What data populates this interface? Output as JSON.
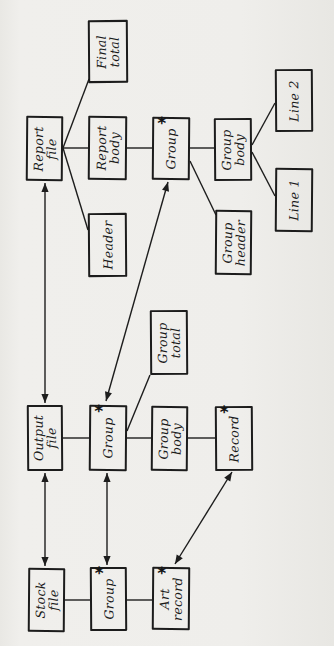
{
  "diagram": {
    "type": "jackson-structure-diagram",
    "ink_color": "#1d1d1d",
    "paper_color": "#efeeeb",
    "iteration_marker": "*",
    "nodes": [
      {
        "id": "report-file",
        "label": "Report\nfile",
        "marker": "",
        "x": 26,
        "y": 116,
        "w": 37,
        "h": 65
      },
      {
        "id": "final-total",
        "label": "Final\ntotal",
        "marker": "",
        "x": 88,
        "y": 20,
        "w": 40,
        "h": 63
      },
      {
        "id": "report-body",
        "label": "Report\nbody",
        "marker": "",
        "x": 88,
        "y": 116,
        "w": 39,
        "h": 64
      },
      {
        "id": "header",
        "label": "Header",
        "marker": "",
        "x": 88,
        "y": 213,
        "w": 39,
        "h": 64
      },
      {
        "id": "group-report",
        "label": "Group",
        "marker": "*",
        "x": 152,
        "y": 117,
        "w": 38,
        "h": 63
      },
      {
        "id": "group-body-report",
        "label": "Group\nbody",
        "marker": "",
        "x": 214,
        "y": 118,
        "w": 38,
        "h": 63
      },
      {
        "id": "group-header",
        "label": "Group\nheader",
        "marker": "",
        "x": 215,
        "y": 210,
        "w": 37,
        "h": 65
      },
      {
        "id": "line-2",
        "label": "Line 2",
        "marker": "",
        "x": 275,
        "y": 69,
        "w": 38,
        "h": 63
      },
      {
        "id": "line-1",
        "label": "Line 1",
        "marker": "",
        "x": 275,
        "y": 168,
        "w": 38,
        "h": 64
      },
      {
        "id": "output-file",
        "label": "Output\nfile",
        "marker": "",
        "x": 27,
        "y": 405,
        "w": 36,
        "h": 66
      },
      {
        "id": "group-output",
        "label": "Group",
        "marker": "*",
        "x": 89,
        "y": 405,
        "w": 38,
        "h": 66
      },
      {
        "id": "group-total",
        "label": "Group\ntotal",
        "marker": "",
        "x": 150,
        "y": 310,
        "w": 38,
        "h": 65
      },
      {
        "id": "group-body-output",
        "label": "Group\nbody",
        "marker": "",
        "x": 151,
        "y": 406,
        "w": 37,
        "h": 65
      },
      {
        "id": "record",
        "label": "Record",
        "marker": "*",
        "x": 215,
        "y": 406,
        "w": 38,
        "h": 65
      },
      {
        "id": "stock-file",
        "label": "Stock\nfile",
        "marker": "",
        "x": 28,
        "y": 568,
        "w": 37,
        "h": 64
      },
      {
        "id": "group-stock",
        "label": "Group",
        "marker": "*",
        "x": 90,
        "y": 567,
        "w": 37,
        "h": 64
      },
      {
        "id": "art-record",
        "label": "Art\nrecord",
        "marker": "*",
        "x": 152,
        "y": 567,
        "w": 38,
        "h": 63
      }
    ],
    "edges": [
      {
        "name": "report-file--final-total",
        "x1": 63,
        "y1": 148,
        "x2": 89,
        "y2": 79,
        "double": false
      },
      {
        "name": "report-file--report-body",
        "x1": 63,
        "y1": 148,
        "x2": 88,
        "y2": 148,
        "double": false
      },
      {
        "name": "report-file--header",
        "x1": 63,
        "y1": 148,
        "x2": 88,
        "y2": 230,
        "double": false
      },
      {
        "name": "report-body--group",
        "x1": 127,
        "y1": 148,
        "x2": 152,
        "y2": 148,
        "double": false
      },
      {
        "name": "group--group-body-report",
        "x1": 190,
        "y1": 148,
        "x2": 214,
        "y2": 148,
        "double": false
      },
      {
        "name": "group--group-header",
        "x1": 190,
        "y1": 161,
        "x2": 216,
        "y2": 215,
        "double": false
      },
      {
        "name": "group-body--line-2",
        "x1": 252,
        "y1": 145,
        "x2": 275,
        "y2": 103,
        "double": false
      },
      {
        "name": "group-body--line-1",
        "x1": 252,
        "y1": 152,
        "x2": 275,
        "y2": 196,
        "double": false
      },
      {
        "name": "output-file--group",
        "x1": 63,
        "y1": 438,
        "x2": 89,
        "y2": 438,
        "double": false
      },
      {
        "name": "group--group-body-output",
        "x1": 127,
        "y1": 438,
        "x2": 151,
        "y2": 438,
        "double": false
      },
      {
        "name": "group-body--record",
        "x1": 188,
        "y1": 438,
        "x2": 215,
        "y2": 438,
        "double": false
      },
      {
        "name": "group--group-total",
        "x1": 127,
        "y1": 431,
        "x2": 150,
        "y2": 375,
        "double": false
      },
      {
        "name": "stock-file--group",
        "x1": 65,
        "y1": 600,
        "x2": 90,
        "y2": 600,
        "double": false
      },
      {
        "name": "group--art-record",
        "x1": 127,
        "y1": 600,
        "x2": 152,
        "y2": 600,
        "double": false
      },
      {
        "name": "report-file--output-file-arrow",
        "x1": 45,
        "y1": 183,
        "x2": 45,
        "y2": 403,
        "double": true
      },
      {
        "name": "output-file--stock-file-arrow",
        "x1": 45,
        "y1": 473,
        "x2": 45,
        "y2": 566,
        "double": true
      },
      {
        "name": "group-output--group-stock-arrow",
        "x1": 107,
        "y1": 473,
        "x2": 107,
        "y2": 565,
        "double": true
      },
      {
        "name": "group-report--group-output-arrow",
        "x1": 168,
        "y1": 182,
        "x2": 106,
        "y2": 401,
        "double": true
      },
      {
        "name": "record--art-record-arrow",
        "x1": 232,
        "y1": 472,
        "x2": 175,
        "y2": 564,
        "double": true
      }
    ]
  }
}
